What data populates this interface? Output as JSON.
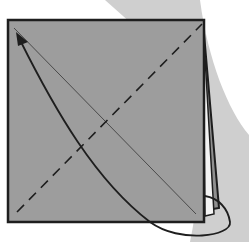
{
  "diagram": {
    "type": "origami-fold-step",
    "colors": {
      "paper": "#9d9d9d",
      "outline": "#1e1e1e",
      "shadow_band": "#c9c9c9",
      "background": "#ffffff",
      "inner_layer": "#f4f4f4"
    },
    "elements": [
      {
        "id": "paper-square",
        "kind": "square",
        "x": 8,
        "y": 20,
        "w": 197,
        "h": 202
      },
      {
        "id": "layer-edges",
        "kind": "stacked-layers",
        "side": "right"
      },
      {
        "id": "crease-line",
        "kind": "thin-line",
        "from": [
          14,
          28
        ],
        "to": [
          196,
          214
        ]
      },
      {
        "id": "valley-fold-line",
        "kind": "dashed-line",
        "from": [
          17,
          212
        ],
        "to": [
          202,
          24
        ]
      },
      {
        "id": "fold-arrow",
        "kind": "curved-arrow",
        "from": "bottom-right-corner",
        "to": "top-left-corner"
      }
    ]
  }
}
